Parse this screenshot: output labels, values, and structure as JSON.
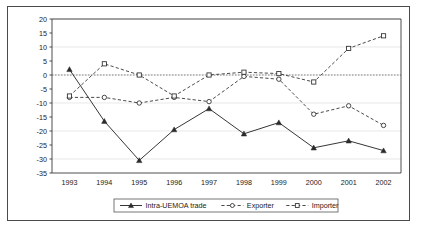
{
  "chart_data": {
    "type": "line",
    "title": "",
    "subtitle": "",
    "xlabel": "",
    "ylabel": "",
    "categories": [
      "1993",
      "1994",
      "1995",
      "1996",
      "1997",
      "1998",
      "1999",
      "2000",
      "2001",
      "2002"
    ],
    "xlim": [
      "1993",
      "2002"
    ],
    "ylim": [
      -35,
      20
    ],
    "ytick_step": 5,
    "yticks": [
      20,
      15,
      10,
      5,
      0,
      -5,
      -10,
      -15,
      -20,
      -25,
      -30,
      -35
    ],
    "ytick_labels": [
      "20",
      "15",
      "10",
      "5",
      "0",
      "-5",
      "-10",
      "-15",
      "-20",
      "-25",
      "-30",
      "-35"
    ],
    "grid": false,
    "zero_reference_line": 0,
    "legend_position": "bottom-center",
    "series": [
      {
        "name": "Intra-UEMOA trade",
        "marker": "triangle",
        "line": "solid",
        "values": [
          2,
          -16.5,
          -30.5,
          -19.5,
          -12,
          -21,
          -17,
          -26,
          -23.5,
          -27
        ]
      },
      {
        "name": "Exporter",
        "marker": "circle",
        "line": "dashed",
        "values": [
          -8,
          -8,
          -10,
          -8,
          -9.5,
          -0.5,
          -1.5,
          -14,
          -11,
          -18
        ]
      },
      {
        "name": "Importer",
        "marker": "square",
        "line": "dashed",
        "values": [
          -7.5,
          4,
          0,
          -7.5,
          0,
          1,
          0.5,
          -2.5,
          9.5,
          14
        ]
      }
    ]
  },
  "colors": {
    "ink": "#2b2b2b",
    "axis": "#3a3a3a",
    "frame": "#4a4a4a",
    "background": "#ffffff",
    "zero_line": "#555555"
  }
}
